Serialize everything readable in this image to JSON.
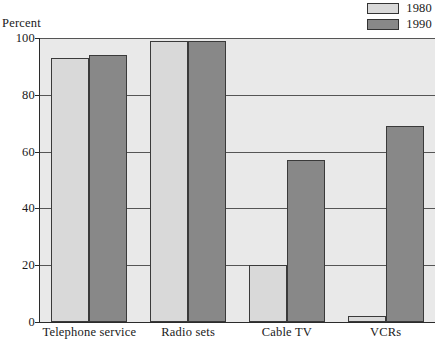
{
  "chart_data": {
    "type": "bar",
    "title": "",
    "xlabel": "",
    "ylabel": "Percent",
    "ylim": [
      0,
      100
    ],
    "yticks": [
      0,
      20,
      40,
      60,
      80,
      100
    ],
    "grid": true,
    "legend_position": "top-right",
    "categories": [
      "Telephone service",
      "Radio sets",
      "Cable TV",
      "VCRs"
    ],
    "series": [
      {
        "name": "1980",
        "color": "#d9d9d9",
        "values": [
          93,
          99,
          20,
          2
        ]
      },
      {
        "name": "1990",
        "color": "#888888",
        "values": [
          94,
          99,
          57,
          69
        ]
      }
    ]
  },
  "axis": {
    "y_title": "Percent",
    "tick_labels": [
      "100",
      "80",
      "60",
      "40",
      "20",
      "0"
    ]
  },
  "legend": {
    "entries": [
      {
        "label": "1980",
        "color": "#d9d9d9"
      },
      {
        "label": "1990",
        "color": "#888888"
      }
    ]
  },
  "colors": {
    "plot_background": "#e9e9e9",
    "axis": "#2b2b2b",
    "gridline": "#555555",
    "bar_border": "#3a3a3a",
    "series_1980": "#d9d9d9",
    "series_1990": "#888888"
  }
}
